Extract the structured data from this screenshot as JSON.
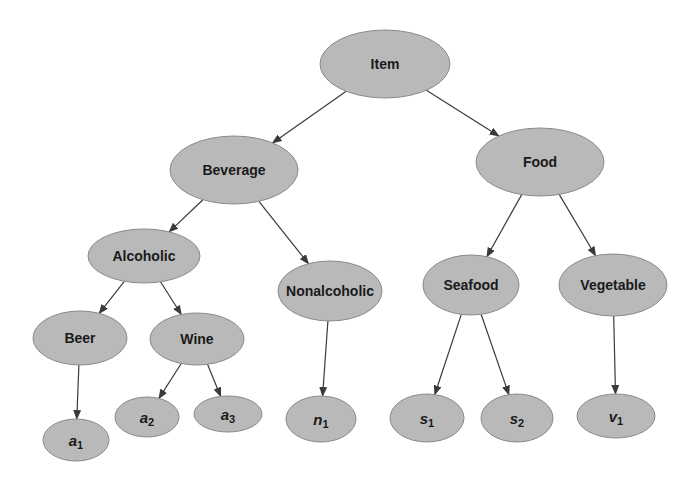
{
  "diagram": {
    "type": "tree",
    "title": "",
    "colors": {
      "node_fill": "#b9b9b9",
      "node_stroke": "#8a8a8a",
      "edge": "#3a3a3a",
      "text": "#1a1a1a",
      "background": "#ffffff"
    },
    "nodes": [
      {
        "id": "item",
        "label": "Item",
        "kind": "concept",
        "cx": 385,
        "cy": 64,
        "rx": 65,
        "ry": 34
      },
      {
        "id": "beverage",
        "label": "Beverage",
        "kind": "concept",
        "cx": 234,
        "cy": 170,
        "rx": 64,
        "ry": 34
      },
      {
        "id": "food",
        "label": "Food",
        "kind": "concept",
        "cx": 540,
        "cy": 162,
        "rx": 64,
        "ry": 34
      },
      {
        "id": "alcoholic",
        "label": "Alcoholic",
        "kind": "concept",
        "cx": 144,
        "cy": 256,
        "rx": 56,
        "ry": 27
      },
      {
        "id": "nonalcoholic",
        "label": "Nonalcoholic",
        "kind": "concept",
        "cx": 330,
        "cy": 291,
        "rx": 52,
        "ry": 30
      },
      {
        "id": "seafood",
        "label": "Seafood",
        "kind": "concept",
        "cx": 471,
        "cy": 285,
        "rx": 48,
        "ry": 30
      },
      {
        "id": "vegetable",
        "label": "Vegetable",
        "kind": "concept",
        "cx": 613,
        "cy": 285,
        "rx": 54,
        "ry": 31
      },
      {
        "id": "beer",
        "label": "Beer",
        "kind": "concept",
        "cx": 80,
        "cy": 338,
        "rx": 47,
        "ry": 27
      },
      {
        "id": "wine",
        "label": "Wine",
        "kind": "concept",
        "cx": 197,
        "cy": 339,
        "rx": 47,
        "ry": 26
      },
      {
        "id": "a1",
        "label": "a",
        "sub": "1",
        "kind": "instance",
        "cx": 76,
        "cy": 440,
        "rx": 33,
        "ry": 21
      },
      {
        "id": "a2",
        "label": "a",
        "sub": "2",
        "kind": "instance",
        "cx": 147,
        "cy": 417,
        "rx": 32,
        "ry": 20
      },
      {
        "id": "a3",
        "label": "a",
        "sub": "3",
        "kind": "instance",
        "cx": 228,
        "cy": 414,
        "rx": 34,
        "ry": 18
      },
      {
        "id": "n1",
        "label": "n",
        "sub": "1",
        "kind": "instance",
        "cx": 321,
        "cy": 419,
        "rx": 35,
        "ry": 23
      },
      {
        "id": "s1",
        "label": "s",
        "sub": "1",
        "kind": "instance",
        "cx": 427,
        "cy": 418,
        "rx": 37,
        "ry": 24
      },
      {
        "id": "s2",
        "label": "s",
        "sub": "2",
        "kind": "instance",
        "cx": 517,
        "cy": 418,
        "rx": 36,
        "ry": 24
      },
      {
        "id": "v1",
        "label": "v",
        "sub": "1",
        "kind": "instance",
        "cx": 616,
        "cy": 416,
        "rx": 39,
        "ry": 22
      }
    ],
    "edges": [
      {
        "from": "item",
        "to": "beverage"
      },
      {
        "from": "item",
        "to": "food"
      },
      {
        "from": "beverage",
        "to": "alcoholic"
      },
      {
        "from": "beverage",
        "to": "nonalcoholic"
      },
      {
        "from": "food",
        "to": "seafood"
      },
      {
        "from": "food",
        "to": "vegetable"
      },
      {
        "from": "alcoholic",
        "to": "beer"
      },
      {
        "from": "alcoholic",
        "to": "wine"
      },
      {
        "from": "beer",
        "to": "a1"
      },
      {
        "from": "wine",
        "to": "a2"
      },
      {
        "from": "wine",
        "to": "a3"
      },
      {
        "from": "nonalcoholic",
        "to": "n1"
      },
      {
        "from": "seafood",
        "to": "s1"
      },
      {
        "from": "seafood",
        "to": "s2"
      },
      {
        "from": "vegetable",
        "to": "v1"
      }
    ]
  }
}
